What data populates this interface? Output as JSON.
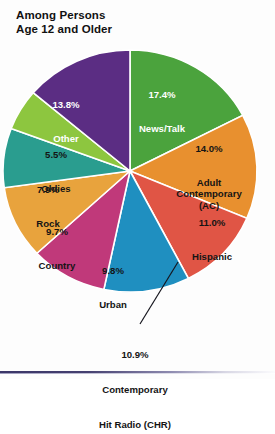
{
  "title": {
    "line1": "Among Persons",
    "line2": "Age 12 and Older"
  },
  "chart_data": {
    "type": "pie",
    "title": "Among Persons Age 12 and Older",
    "subtitle": "",
    "xlabel": "",
    "ylabel": "",
    "legend": "none",
    "grid": false,
    "units": "percent",
    "categories": [
      "News/Talk",
      "Adult Contemporary (AC)",
      "Hispanic",
      "Contemporary Hit Radio (CHR)",
      "Urban",
      "Country",
      "Rock",
      "Oldies",
      "Other"
    ],
    "values": [
      17.4,
      14.0,
      11.0,
      10.9,
      9.8,
      9.7,
      7.9,
      5.5,
      13.8
    ],
    "total": 100.0,
    "slices": [
      {
        "name": "News/Talk",
        "pct": "17.4%",
        "value": 17.4,
        "color": "#4ba33d",
        "label_lines": [
          "17.4%",
          "News/Talk"
        ],
        "label_color": "#ffffff",
        "label_x": 126,
        "label_y": 66,
        "label_w": 72
      },
      {
        "name": "Adult Contemporary (AC)",
        "pct": "14.0%",
        "value": 14.0,
        "color": "#e8902f",
        "label_lines": [
          "14.0%",
          "Adult",
          "Contemporary",
          "(AC)"
        ],
        "label_color": "#141414",
        "label_x": 166,
        "label_y": 120,
        "label_w": 84
      },
      {
        "name": "Hispanic",
        "pct": "11.0%",
        "value": 11.0,
        "color": "#e05545",
        "label_lines": [
          "11.0%",
          "Hispanic"
        ],
        "label_color": "#141414",
        "label_x": 176,
        "label_y": 194,
        "label_w": 72
      },
      {
        "name": "Contemporary Hit Radio (CHR)",
        "pct": "10.9%",
        "value": 10.9,
        "color": "#1f8fc0",
        "label_lines": [
          "10.9%",
          "Contemporary",
          "Hit Radio (CHR)"
        ],
        "label_color": "#141414",
        "label_x": 0,
        "label_y": 0,
        "label_w": 0
      },
      {
        "name": "Urban",
        "pct": "9.8%",
        "value": 9.8,
        "color": "#c0397a",
        "label_lines": [
          "9.8%",
          "Urban"
        ],
        "label_color": "#141414",
        "label_x": 84,
        "label_y": 242,
        "label_w": 58
      },
      {
        "name": "Country",
        "pct": "9.7%",
        "value": 9.7,
        "color": "#e8a33d",
        "label_lines": [
          "9.7%",
          "Country"
        ],
        "label_color": "#141414",
        "label_x": 24,
        "label_y": 203,
        "label_w": 66
      },
      {
        "name": "Rock",
        "pct": "7.9%",
        "value": 7.9,
        "color": "#2a9d8f",
        "label_lines": [
          "7.9%",
          "Rock"
        ],
        "label_color": "#141414",
        "label_x": 18,
        "label_y": 161,
        "label_w": 60
      },
      {
        "name": "Oldies",
        "pct": "5.5%",
        "value": 5.5,
        "color": "#8dc63f",
        "label_lines": [
          "5.5%",
          "Oldies"
        ],
        "label_color": "#141414",
        "label_x": 26,
        "label_y": 126,
        "label_w": 60
      },
      {
        "name": "Other",
        "pct": "13.8%",
        "value": 13.8,
        "color": "#5b2d83",
        "label_lines": [
          "13.8%",
          "Other"
        ],
        "label_color": "#ffffff",
        "label_x": 33,
        "label_y": 76,
        "label_w": 66
      }
    ],
    "callout": {
      "target": "Contemporary Hit Radio (CHR)",
      "line1": "10.9%",
      "line2": "Contemporary",
      "line3": "Hit Radio (CHR)"
    }
  },
  "slice_labels": {
    "news_talk": "17.4%\nNews/Talk",
    "ac": "14.0%\nAdult\nContemporary\n(AC)",
    "hispanic": "11.0%\nHispanic",
    "urban": "9.8%\nUrban",
    "country": "9.7%\nCountry",
    "rock": "7.9%\nRock",
    "oldies": "5.5%\nOldies",
    "other": "13.8%\nOther",
    "chr": "10.9%\nContemporary\nHit Radio (CHR)"
  }
}
